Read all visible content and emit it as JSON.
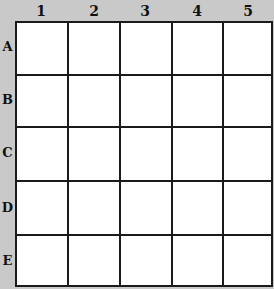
{
  "columns": [
    "1",
    "2",
    "3",
    "4",
    "5"
  ],
  "rows": [
    "A",
    "B",
    "C",
    "D",
    "E"
  ],
  "cells": [
    [
      "",
      "",
      "",
      "",
      ""
    ],
    [
      "",
      "",
      "",
      "",
      ""
    ],
    [
      "",
      "",
      "",
      "",
      ""
    ],
    [
      "",
      "",
      "",
      "",
      ""
    ],
    [
      "",
      "",
      "",
      "",
      ""
    ]
  ],
  "colors": {
    "background": "#c9c9c9",
    "grid_line": "#1a1a1a",
    "cell_fill": "#ffffff"
  }
}
